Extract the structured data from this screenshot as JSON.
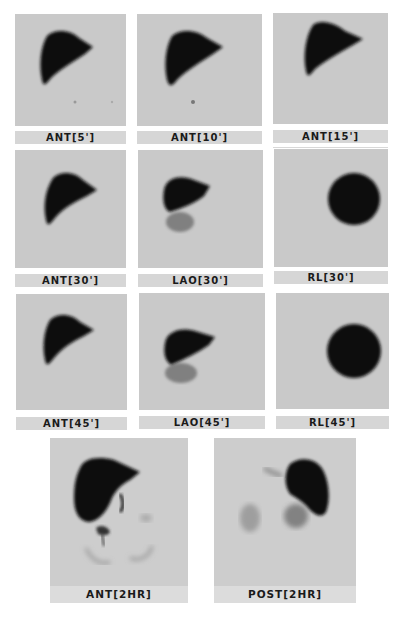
{
  "figure": {
    "type": "nuclear-medicine-liver-spleen-scan-series",
    "panels": [
      {
        "label": "ANT[5']",
        "view": "anterior",
        "time": "5 min",
        "organ_shape": "liver-ant"
      },
      {
        "label": "ANT[10']",
        "view": "anterior",
        "time": "10 min",
        "organ_shape": "liver-ant"
      },
      {
        "label": "ANT[15']",
        "view": "anterior",
        "time": "15 min",
        "organ_shape": "liver-ant"
      },
      {
        "label": "ANT[30']",
        "view": "anterior",
        "time": "30 min",
        "organ_shape": "liver-ant"
      },
      {
        "label": "LAO[30']",
        "view": "left anterior oblique",
        "time": "30 min",
        "organ_shape": "liver-lao"
      },
      {
        "label": "RL[30']",
        "view": "right lateral",
        "time": "30 min",
        "organ_shape": "liver-rl"
      },
      {
        "label": "ANT[45']",
        "view": "anterior",
        "time": "45 min",
        "organ_shape": "liver-ant"
      },
      {
        "label": "LAO[45']",
        "view": "left anterior oblique",
        "time": "45 min",
        "organ_shape": "liver-lao"
      },
      {
        "label": "RL[45']",
        "view": "right lateral",
        "time": "45 min",
        "organ_shape": "liver-rl"
      },
      {
        "label": "ANT[2HR]",
        "view": "anterior",
        "time": "2 hr",
        "organ_shape": "liver-ant-2hr"
      },
      {
        "label": "POST[2HR]",
        "view": "posterior",
        "time": "2 hr",
        "organ_shape": "liver-post-2hr"
      }
    ],
    "colors": {
      "background": "#ffffff",
      "scan_background": "#c9c9c9",
      "label_background": "#d6d6d6",
      "uptake": "#111111"
    }
  }
}
